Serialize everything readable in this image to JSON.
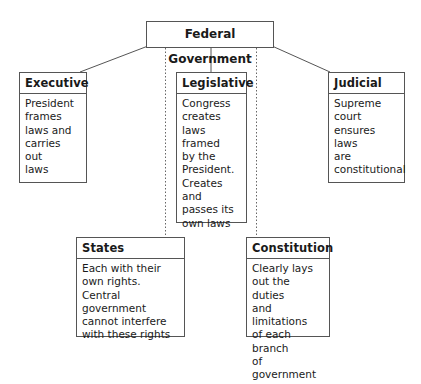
{
  "diagram": {
    "root": {
      "label": "Federal Government"
    },
    "branches": [
      {
        "id": "executive",
        "title": "Executive",
        "body": "President\nframes\nlaws and\ncarries\nout\nlaws",
        "connector": "solid"
      },
      {
        "id": "legislative",
        "title": "Legislative",
        "body": "Congress\ncreates\nlaws framed\nby the\nPresident.\nCreates\nand\npasses its\nown laws",
        "connector": "solid"
      },
      {
        "id": "judicial",
        "title": "Judicial",
        "body": "Supreme\ncourt\nensures\nlaws\nare\nconstitutional",
        "connector": "solid"
      }
    ],
    "related": [
      {
        "id": "states",
        "title": "States",
        "body": "Each with their\nown rights.\nCentral government\ncannot interfere\nwith these rights",
        "connector": "dotted"
      },
      {
        "id": "constitution",
        "title": "Constitution",
        "body": "Clearly lays\nout the duties\nand limitations\nof each branch\nof government",
        "connector": "dotted"
      }
    ],
    "colors": {
      "line": "#555555",
      "text": "#1a1a1a",
      "background": "#ffffff"
    }
  }
}
